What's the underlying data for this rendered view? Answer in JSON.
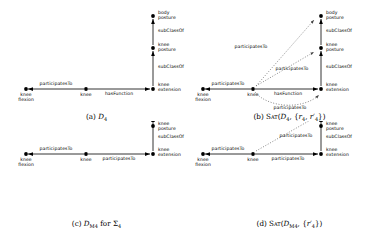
{
  "figure": {
    "node_dot_color": "#000000",
    "edge_color": "#000000",
    "dotted_edge_color": "#555555"
  },
  "panels": [
    {
      "id": "a",
      "caption_parts": {
        "tag": "(a)",
        "symbol": "D",
        "sub": "4",
        "suffix": ""
      },
      "nodes": [
        {
          "name": "knee-flexion",
          "label": "knee\nflexion"
        },
        {
          "name": "knee",
          "label": "knee"
        },
        {
          "name": "knee-extension",
          "label": "knee\nextension"
        },
        {
          "name": "knee-posture",
          "label": "knee\nposture"
        },
        {
          "name": "body-posture",
          "label": "body\nposture"
        }
      ],
      "edges": [
        {
          "name": "edge-participates-to-flexion",
          "label": "participatesTo",
          "style": "solid"
        },
        {
          "name": "edge-has-function",
          "label": "hasFunction",
          "style": "solid"
        },
        {
          "name": "edge-subclassof-lower",
          "label": "subClassOf",
          "style": "solid"
        },
        {
          "name": "edge-subclassof-upper",
          "label": "subClassOf",
          "style": "solid"
        }
      ]
    },
    {
      "id": "b",
      "caption_parts": {
        "tag": "(b)",
        "fn": "Sat",
        "open": "(",
        "symbol": "D",
        "sub": "4",
        "mid": ", {",
        "r1": "r",
        "r1sub": "4",
        "r2": "r",
        "r2sub": "4",
        "close": "})"
      },
      "nodes": [
        {
          "name": "knee-flexion",
          "label": "knee\nflexion"
        },
        {
          "name": "knee",
          "label": "knee"
        },
        {
          "name": "knee-extension",
          "label": "knee\nextension"
        },
        {
          "name": "knee-posture",
          "label": "knee\nposture"
        },
        {
          "name": "body-posture",
          "label": "body\nposture"
        }
      ],
      "edges": [
        {
          "name": "edge-participates-to-flexion",
          "label": "participatesTo",
          "style": "solid"
        },
        {
          "name": "edge-has-function",
          "label": "hasFunction",
          "style": "solid"
        },
        {
          "name": "edge-subclassof-lower",
          "label": "subClassOf",
          "style": "solid"
        },
        {
          "name": "edge-subclassof-upper",
          "label": "subClassOf",
          "style": "solid"
        },
        {
          "name": "edge-inferred-body-posture",
          "label": "participatesTo",
          "style": "dotted"
        },
        {
          "name": "edge-inferred-knee-posture",
          "label": "participatesTo",
          "style": "dotted"
        },
        {
          "name": "edge-inferred-knee-extension",
          "label": "participatesTo",
          "style": "dotted"
        }
      ]
    },
    {
      "id": "c",
      "caption_parts": {
        "tag": "(c)",
        "symbol": "D",
        "sub": "M4",
        "word": "for",
        "sigma": "Σ",
        "sigmasub": "4"
      },
      "nodes": [
        {
          "name": "knee-flexion",
          "label": "knee\nflexion"
        },
        {
          "name": "knee",
          "label": "knee"
        },
        {
          "name": "knee-extension",
          "label": "knee\nextension"
        },
        {
          "name": "knee-posture",
          "label": "knee\nposture"
        }
      ],
      "edges": [
        {
          "name": "edge-participates-to-flexion",
          "label": "participatesTo",
          "style": "solid"
        },
        {
          "name": "edge-participates-to-extension",
          "label": "participatesTo",
          "style": "solid"
        },
        {
          "name": "edge-subclassof",
          "label": "subClassOf",
          "style": "solid"
        }
      ]
    },
    {
      "id": "d",
      "caption_parts": {
        "tag": "(d)",
        "fn": "Sat",
        "open": "(",
        "symbol": "D",
        "sub": "M4",
        "mid": ", {",
        "r1": "r",
        "r1sub": "4",
        "close": "})"
      },
      "nodes": [
        {
          "name": "knee-flexion",
          "label": "knee\nflexion"
        },
        {
          "name": "knee",
          "label": "knee"
        },
        {
          "name": "knee-extension",
          "label": "knee\nextension"
        },
        {
          "name": "knee-posture",
          "label": "knee\nposture"
        }
      ],
      "edges": [
        {
          "name": "edge-participates-to-flexion",
          "label": "participatesTo",
          "style": "solid"
        },
        {
          "name": "edge-participates-to-extension",
          "label": "participatesTo",
          "style": "solid"
        },
        {
          "name": "edge-subclassof",
          "label": "subClassOf",
          "style": "solid"
        },
        {
          "name": "edge-inferred-knee-posture",
          "label": "participatesTo",
          "style": "dotted"
        }
      ]
    }
  ],
  "labels": {
    "knee_flexion_l1": "knee",
    "knee_flexion_l2": "flexion",
    "knee": "knee",
    "knee_extension_l1": "knee",
    "knee_extension_l2": "extension",
    "knee_posture_l1": "knee",
    "knee_posture_l2": "posture",
    "body_posture_l1": "body",
    "body_posture_l2": "posture",
    "participates_to": "participatesTo",
    "has_function": "hasFunction",
    "sub_class_of": "subClassOf"
  }
}
